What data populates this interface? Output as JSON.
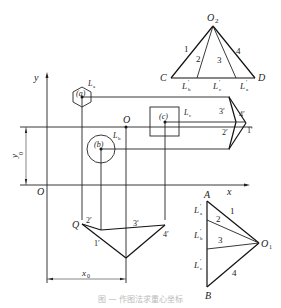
{
  "figure": {
    "top_triangle": {
      "apex": "O2",
      "apex_sub": "2",
      "left": "C",
      "right": "D",
      "rays": [
        "1",
        "2",
        "3",
        "4"
      ],
      "base_labels": [
        {
          "main": "L",
          "sub": "b",
          "prime": "′"
        },
        {
          "main": "L",
          "sub": "c",
          "prime": "′"
        },
        {
          "main": "L",
          "sub": "a",
          "prime": "′"
        }
      ]
    },
    "plan": {
      "axis_y": "y",
      "axis_x": "x",
      "origin": "O",
      "dim_y": {
        "main": "y",
        "sub": "0"
      },
      "dim_x": {
        "main": "x",
        "sub": "0"
      },
      "pole_O": "O",
      "loads": [
        {
          "id": "(a)",
          "label_main": "L",
          "label_sub": "a",
          "shape": "hexagon"
        },
        {
          "id": "(b)",
          "label_main": "L",
          "label_sub": "b",
          "shape": "circle"
        },
        {
          "id": "(c)",
          "label_main": "L",
          "label_sub": "c",
          "shape": "square"
        }
      ],
      "right_funicular_labels": [
        "3′",
        "4′",
        "2′",
        "1′"
      ],
      "bottom_funicular": {
        "start": "Q",
        "labels": [
          "2′",
          "3′",
          "1′",
          "4′"
        ]
      }
    },
    "bottom_triangle": {
      "top": "A",
      "bottom": "B",
      "pole": "O",
      "pole_sub": "1",
      "rays": [
        "1",
        "2",
        "3",
        "4"
      ],
      "side_labels": [
        {
          "main": "L",
          "sub": "a",
          "prime": "′"
        },
        {
          "main": "L",
          "sub": "b",
          "prime": "′"
        },
        {
          "main": "L",
          "sub": "c",
          "prime": "′"
        }
      ]
    },
    "caption": "图 — 作图法求重心坐标"
  }
}
